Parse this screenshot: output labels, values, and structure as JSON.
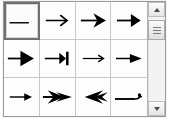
{
  "widget": {
    "name": "Arrowhead / line-end style picker",
    "columns": 4,
    "rows": 3,
    "selected_index": 0,
    "background_color": "#ffffff",
    "grid_line_color": "#c8c8c8",
    "border_color": "#9a9a9a",
    "selection_border_color": "#707070",
    "glyph_color": "#000000"
  },
  "swatches": [
    {
      "index": 0,
      "icon": "line-no-arrow-icon",
      "label": "None (plain line)",
      "selected": true
    },
    {
      "index": 1,
      "icon": "arrow-open-thin-icon",
      "label": "Thin open arrow",
      "selected": false
    },
    {
      "index": 2,
      "icon": "arrow-filled-concave-icon",
      "label": "Filled concave arrow",
      "selected": false
    },
    {
      "index": 3,
      "icon": "arrow-filled-solid-icon",
      "label": "Solid filled arrow",
      "selected": false
    },
    {
      "index": 4,
      "icon": "arrow-filled-wide-icon",
      "label": "Wide filled arrow",
      "selected": false
    },
    {
      "index": 5,
      "icon": "arrow-with-bar-icon",
      "label": "Arrow with end bar",
      "selected": false
    },
    {
      "index": 6,
      "icon": "arrow-small-open-icon",
      "label": "Small open arrow",
      "selected": false
    },
    {
      "index": 7,
      "icon": "arrow-tapered-icon",
      "label": "Tapered filled arrow",
      "selected": false
    },
    {
      "index": 8,
      "icon": "arrow-small-filled-icon",
      "label": "Small filled arrow",
      "selected": false
    },
    {
      "index": 9,
      "icon": "arrow-double-wing-icon",
      "label": "Double-wing arrow",
      "selected": false
    },
    {
      "index": 10,
      "icon": "arrow-reversed-wing-icon",
      "label": "Reversed wing arrow",
      "selected": false
    },
    {
      "index": 11,
      "icon": "arrow-curved-hook-icon",
      "label": "Curved hook tail",
      "selected": false
    }
  ],
  "scrollbar": {
    "orientation": "vertical",
    "up_button": "scroll-up-arrow-icon",
    "down_button": "scroll-down-arrow-icon",
    "thumb_position_percent": 3,
    "thumb_size_percent": 24
  }
}
